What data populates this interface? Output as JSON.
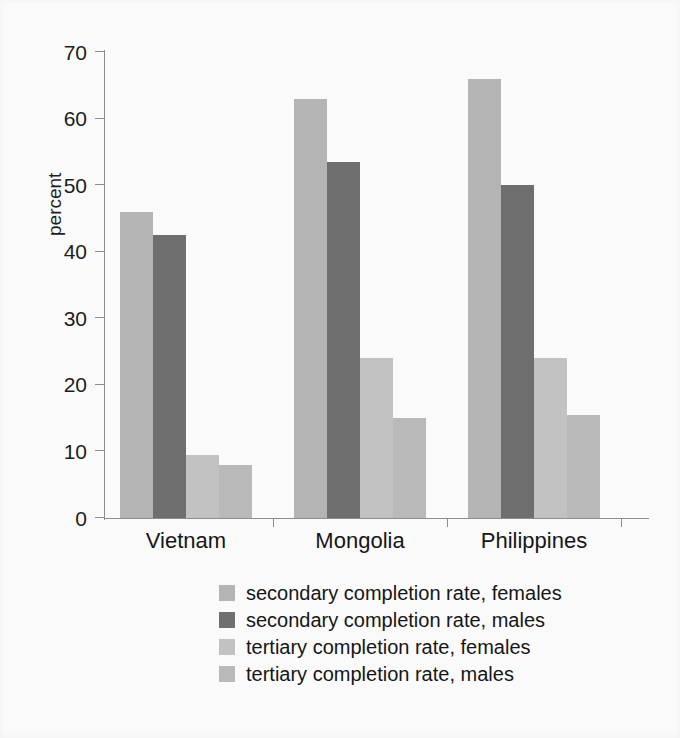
{
  "chart_data": {
    "type": "bar",
    "title": "",
    "xlabel": "",
    "ylabel": "percent",
    "ylim": [
      0,
      70
    ],
    "yticks": [
      0,
      10,
      20,
      30,
      40,
      50,
      60,
      70
    ],
    "grid": false,
    "legend_position": "bottom",
    "categories": [
      "Vietnam",
      "Mongolia",
      "Philippines"
    ],
    "series": [
      {
        "name": "secondary completion rate, females",
        "color": "#b4b4b4",
        "values": [
          46,
          63,
          66
        ]
      },
      {
        "name": "secondary completion rate, males",
        "color": "#6e6e6e",
        "values": [
          42.5,
          53.5,
          50
        ]
      },
      {
        "name": "tertiary completion rate, females",
        "color": "#c2c2c2",
        "values": [
          9.5,
          24,
          24
        ]
      },
      {
        "name": "tertiary completion rate, males",
        "color": "#b9b9b9",
        "values": [
          8,
          15,
          15.5
        ]
      }
    ]
  },
  "axis": {
    "y_title": "percent",
    "y_tick_labels": [
      "0",
      "10",
      "20",
      "30",
      "40",
      "50",
      "60",
      "70"
    ]
  },
  "legend": {
    "items": [
      {
        "label": "secondary completion rate, females",
        "color": "#b4b4b4"
      },
      {
        "label": "secondary completion rate, males",
        "color": "#6e6e6e"
      },
      {
        "label": "tertiary completion rate, females",
        "color": "#c2c2c2"
      },
      {
        "label": "tertiary completion rate, males",
        "color": "#b9b9b9"
      }
    ]
  }
}
